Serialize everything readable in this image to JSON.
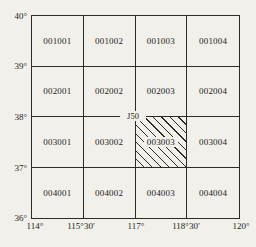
{
  "figure": {
    "bg_color": "#f2f0eb",
    "line_color": "#2b2b2b",
    "marker_label": "J50",
    "hatched_cell": "003003"
  },
  "lat_labels": [
    "40°",
    "39°",
    "38°",
    "37°",
    "36°"
  ],
  "lon_labels": [
    "114°",
    "115°30′",
    "117°",
    "118°30′",
    "120°"
  ],
  "cells": {
    "r1": [
      "001001",
      "001002",
      "001003",
      "001004"
    ],
    "r2": [
      "002001",
      "002002",
      "002003",
      "002004"
    ],
    "r3": [
      "003001",
      "003002",
      "003003",
      "003004"
    ],
    "r4": [
      "004001",
      "004002",
      "004003",
      "004004"
    ]
  }
}
